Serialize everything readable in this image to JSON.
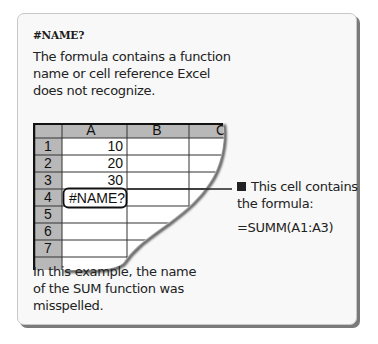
{
  "card": {
    "title": "#NAME?",
    "description_lines": [
      "The formula contains a function",
      "name or cell reference Excel",
      "does not recognize."
    ]
  },
  "spreadsheet": {
    "columns": [
      "A",
      "B",
      "C"
    ],
    "rows": [
      {
        "row": "1",
        "A": "10",
        "B": ""
      },
      {
        "row": "2",
        "A": "20",
        "B": ""
      },
      {
        "row": "3",
        "A": "30",
        "B": ""
      },
      {
        "row": "4",
        "A": "#NAME?",
        "B": ""
      },
      {
        "row": "5",
        "A": "",
        "B": ""
      },
      {
        "row": "6",
        "A": "",
        "B": ""
      },
      {
        "row": "7",
        "A": "",
        "B": ""
      }
    ],
    "highlighted_cell": "A4",
    "header_color": "#b8b8b8"
  },
  "callout": {
    "lines": [
      "This cell contains",
      "the formula:"
    ],
    "formula": "=SUMM(A1:A3)"
  },
  "note": {
    "lines": [
      "In this example, the name",
      "of the SUM function was",
      "misspelled."
    ]
  }
}
